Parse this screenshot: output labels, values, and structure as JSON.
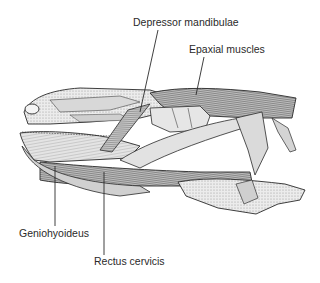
{
  "figure": {
    "labels": [
      {
        "id": "depressor",
        "text": "Depressor mandibulae"
      },
      {
        "id": "epaxial",
        "text": "Epaxial muscles"
      },
      {
        "id": "geniohyoideus",
        "text": "Geniohyoideus"
      },
      {
        "id": "rectus",
        "text": "Rectus cervicis"
      }
    ]
  },
  "colors": {
    "ink": "#2a2a2a",
    "shade_dark": "#555555",
    "shade_mid": "#9a9a9a",
    "shade_light": "#d6d6d6",
    "paper": "#ffffff"
  }
}
